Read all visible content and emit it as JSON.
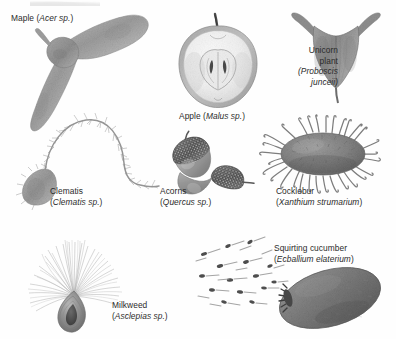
{
  "figure": {
    "background_color": "#fefefe",
    "label_color": "#2b2b2b",
    "ink_color": "#8a8a8a",
    "style": "grayscale halftone botanical illustration plate"
  },
  "specimens": [
    {
      "id": "maple",
      "common_name": "Maple",
      "scientific_name": "Acer sp.",
      "sci_prefix": "(",
      "sci_suffix": " sp.)",
      "dispersal": "wind",
      "label_lines": [
        "Maple (Acer sp.)"
      ]
    },
    {
      "id": "apple",
      "common_name": "Apple",
      "scientific_name": "Malus sp.",
      "sci_prefix": "(",
      "sci_suffix": " sp.)",
      "dispersal": "animal",
      "label_lines": [
        "Apple (Malus sp.)"
      ]
    },
    {
      "id": "unicorn-plant",
      "common_name_line1": "Unicorn",
      "common_name_line2": "plant",
      "scientific_name_line1": "(Proboscis",
      "scientific_name_line2": "junceii)",
      "dispersal": "animal attachment",
      "label_lines": [
        "Unicorn",
        "plant",
        "(Proboscis",
        "junceii)"
      ]
    },
    {
      "id": "clematis",
      "common_name": "Clematis",
      "scientific_name": "Clematis sp.",
      "sci_prefix": "(",
      "sci_suffix": " sp.)",
      "dispersal": "wind",
      "label_lines": [
        "Clematis",
        "(Clematis sp.)"
      ]
    },
    {
      "id": "acorns",
      "common_name": "Acorns",
      "scientific_name": "Quercus sp.",
      "sci_prefix": "(",
      "sci_suffix": " sp.)",
      "dispersal": "animal",
      "label_lines": [
        "Acorns",
        "(Quercus sp.)"
      ]
    },
    {
      "id": "cocklebur",
      "common_name": "Cocklebur",
      "scientific_name": "Xanthium strumarium",
      "sci_prefix": "(",
      "sci_suffix": ")",
      "dispersal": "animal attachment",
      "label_lines": [
        "Cocklebur",
        "(Xanthium strumarium)"
      ]
    },
    {
      "id": "milkweed",
      "common_name": "Milkweed",
      "scientific_name": "Asclepias sp.",
      "sci_prefix": "(",
      "sci_suffix": " sp.)",
      "dispersal": "wind",
      "label_lines": [
        "Milkweed",
        "(Asclepias sp.)"
      ]
    },
    {
      "id": "squirting-cucumber",
      "common_name": "Squirting cucumber",
      "scientific_name": "Ecballium elaterium",
      "sci_prefix": "(",
      "sci_suffix": ")",
      "dispersal": "explosive ejection",
      "label_lines": [
        "Squirting cucumber",
        "(Ecballium elaterium)"
      ]
    }
  ]
}
